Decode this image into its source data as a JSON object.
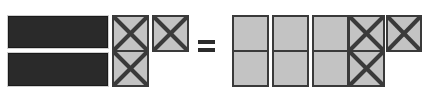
{
  "diagram": {
    "type": "visual-math-equation",
    "operator_label": "=",
    "colors": {
      "bar_fill": "#2a2a2a",
      "bar_border": "#1a1a1a",
      "tile_fill": "#c3c3c3",
      "tile_border": "#3a3a3a",
      "x_stroke": "#3a3a3a",
      "background": "#ffffff",
      "equals": "#2b2b2b"
    },
    "left_side": {
      "name": "left-expression",
      "bars": [
        {
          "label": "whole-bar-top",
          "x": 8,
          "y": 16,
          "w": 100,
          "h": 32
        },
        {
          "label": "whole-bar-bottom",
          "x": 8,
          "y": 53,
          "w": 100,
          "h": 33
        }
      ],
      "x_tiles": [
        {
          "label": "x-tile-left-top",
          "x": 112,
          "y": 15,
          "w": 37,
          "h": 37
        },
        {
          "label": "x-tile-left-bottom",
          "x": 112,
          "y": 50,
          "w": 37,
          "h": 37
        },
        {
          "label": "x-tile-left-right",
          "x": 152,
          "y": 15,
          "w": 37,
          "h": 37
        }
      ],
      "bar_count": 2,
      "x_tile_count": 3
    },
    "operator": {
      "name": "equals-sign",
      "x": 198,
      "y": 40,
      "w": 17,
      "h": 12
    },
    "right_side": {
      "name": "right-expression",
      "plain_tiles": [
        {
          "label": "tile-r1c1",
          "x": 232,
          "y": 15,
          "w": 37,
          "h": 37
        },
        {
          "label": "tile-r1c2",
          "x": 272,
          "y": 15,
          "w": 37,
          "h": 37
        },
        {
          "label": "tile-r1c3",
          "x": 312,
          "y": 15,
          "w": 37,
          "h": 37
        },
        {
          "label": "tile-r2c1",
          "x": 232,
          "y": 50,
          "w": 37,
          "h": 37
        },
        {
          "label": "tile-r2c2",
          "x": 272,
          "y": 50,
          "w": 37,
          "h": 37
        },
        {
          "label": "tile-r2c3",
          "x": 312,
          "y": 50,
          "w": 37,
          "h": 37
        }
      ],
      "x_tiles": [
        {
          "label": "x-tile-r1c4",
          "x": 348,
          "y": 15,
          "w": 37,
          "h": 37
        },
        {
          "label": "x-tile-r2c4",
          "x": 348,
          "y": 50,
          "w": 37,
          "h": 37
        },
        {
          "label": "x-tile-r1c5",
          "x": 386,
          "y": 15,
          "w": 36,
          "h": 37
        }
      ],
      "plain_tile_count": 6,
      "x_tile_count": 3
    }
  }
}
